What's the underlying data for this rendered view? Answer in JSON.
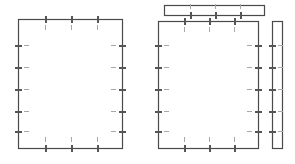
{
  "document": {
    "title": "Panel Outline Drawing",
    "background_color": "#ffffff",
    "line_color": "#4a4a4a",
    "tick_color": "#555555",
    "inner_dash_color": "#a8a8a8",
    "line_width": 1.2,
    "canvas": {
      "width": 295,
      "height": 164
    }
  },
  "parts": [
    {
      "id": "left-panel",
      "name": "Left Panel Outline",
      "shape": "rectangle",
      "x": 18,
      "y": 19,
      "width": 104,
      "height": 129,
      "ticks": {
        "top": {
          "count": 3,
          "positions": [
            27,
            53,
            79
          ]
        },
        "bottom": {
          "count": 3,
          "positions": [
            27,
            53,
            79
          ]
        },
        "left": {
          "count": 5,
          "positions": [
            26,
            48,
            70,
            92,
            112
          ]
        },
        "right": {
          "count": 5,
          "positions": [
            26,
            48,
            70,
            92,
            112
          ]
        }
      }
    },
    {
      "id": "right-panel",
      "name": "Right Panel Outline",
      "shape": "rectangle",
      "x": 158,
      "y": 21,
      "width": 100,
      "height": 127,
      "ticks": {
        "top": {
          "count": 3,
          "positions": [
            26,
            51,
            76
          ]
        },
        "bottom": {
          "count": 3,
          "positions": [
            26,
            51,
            76
          ]
        },
        "left": {
          "count": 5,
          "positions": [
            24,
            46,
            68,
            90,
            110
          ]
        },
        "right": {
          "count": 5,
          "positions": [
            24,
            46,
            68,
            90,
            110
          ]
        }
      }
    },
    {
      "id": "top-rail",
      "name": "Top Horizontal Rail",
      "shape": "rectangle",
      "x": 164,
      "y": 5,
      "width": 100,
      "height": 10,
      "ticks": {
        "bottom": {
          "count": 3,
          "positions": [
            26,
            51,
            76
          ]
        }
      }
    },
    {
      "id": "side-rail",
      "name": "Right Vertical Rail",
      "shape": "rectangle",
      "x": 272,
      "y": 21,
      "width": 10,
      "height": 127,
      "ticks": {
        "left": {
          "count": 5,
          "positions": [
            24,
            46,
            68,
            90,
            110
          ]
        }
      }
    }
  ],
  "tick_style": {
    "mark_length": 7,
    "mark_thickness": 2,
    "inner_dash_length": 5,
    "inner_dash_offset": 6
  }
}
